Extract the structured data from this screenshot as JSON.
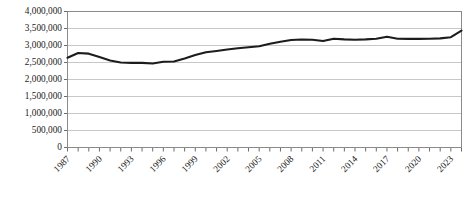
{
  "chart_data": {
    "type": "line",
    "title": "",
    "xlabel": "",
    "ylabel": "",
    "ylim": [
      0,
      4000000
    ],
    "xlim": [
      1987,
      2024
    ],
    "grid": true,
    "legend": "none",
    "y_ticks": [
      "4,000,000",
      "3,500,000",
      "3,000,000",
      "2,500,000",
      "2,000,000",
      "1,500,000",
      "1,000,000",
      "500,000",
      "0"
    ],
    "y_tick_values": [
      4000000,
      3500000,
      3000000,
      2500000,
      2000000,
      1500000,
      1000000,
      500000,
      0
    ],
    "x_tick_labels": [
      "1987",
      "1990",
      "1993",
      "1996",
      "1999",
      "2002",
      "2005",
      "2008",
      "2011",
      "2014",
      "2017",
      "2020",
      "2023"
    ],
    "x_tick_label_interval": 3,
    "x_tick_label_rotation": -45,
    "x": [
      1987,
      1988,
      1989,
      1990,
      1991,
      1992,
      1993,
      1994,
      1995,
      1996,
      1997,
      1998,
      1999,
      2000,
      2001,
      2002,
      2003,
      2004,
      2005,
      2006,
      2007,
      2008,
      2009,
      2010,
      2011,
      2012,
      2013,
      2014,
      2015,
      2016,
      2017,
      2018,
      2019,
      2020,
      2021,
      2022,
      2023,
      2024
    ],
    "series": [
      {
        "name": "series-1",
        "color": "#1c1c1c",
        "values": [
          2640000,
          2780000,
          2760000,
          2660000,
          2560000,
          2500000,
          2490000,
          2490000,
          2470000,
          2520000,
          2530000,
          2620000,
          2720000,
          2800000,
          2840000,
          2880000,
          2920000,
          2950000,
          2980000,
          3050000,
          3110000,
          3160000,
          3175000,
          3170000,
          3130000,
          3200000,
          3180000,
          3170000,
          3180000,
          3200000,
          3255000,
          3200000,
          3195000,
          3195000,
          3200000,
          3210000,
          3245000,
          3440000
        ]
      }
    ]
  }
}
